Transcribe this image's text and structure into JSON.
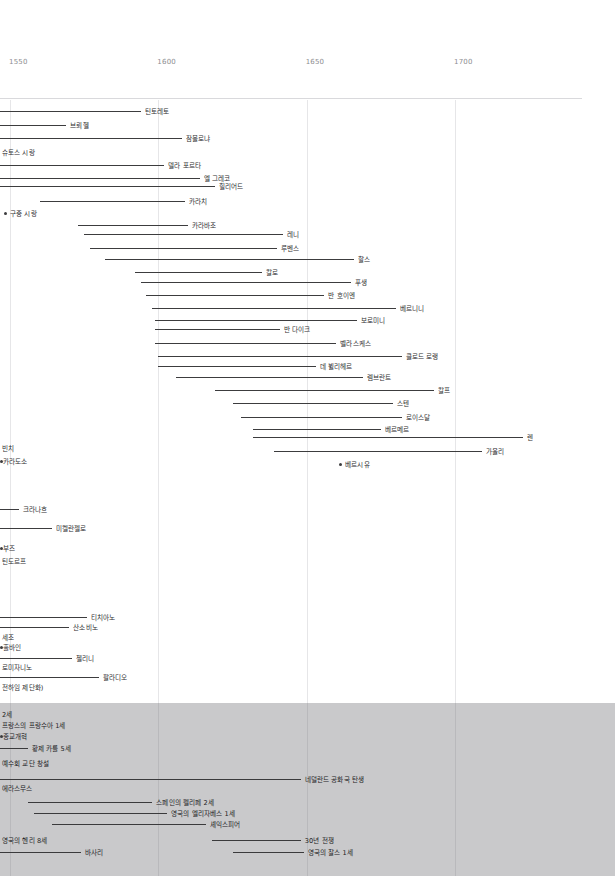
{
  "chart_data": {
    "type": "table",
    "title": "",
    "subtitle": "",
    "xlabel": "",
    "ylabel": "",
    "xlim": [
      1530,
      1720
    ],
    "grid": true,
    "legend": "none",
    "axis": {
      "ticks": [
        {
          "label": "1550",
          "value": 1550
        },
        {
          "label": "1600",
          "value": 1600
        },
        {
          "label": "1650",
          "value": 1650
        },
        {
          "label": "1700",
          "value": 1700
        }
      ]
    },
    "artists": [
      {
        "label": "틴토레토",
        "start": 1530,
        "end": 1594,
        "marker": "bar"
      },
      {
        "label": "브뢰헬",
        "start": 1530,
        "end": 1569,
        "marker": "bar"
      },
      {
        "label": "잠볼로냐",
        "start": 1530,
        "end": 1608,
        "marker": "bar"
      },
      {
        "label": "슈토스 시랑",
        "start": 1530,
        "end": 1530,
        "marker": "none"
      },
      {
        "label": "델라 포르타",
        "start": 1530,
        "end": 1602,
        "marker": "bar"
      },
      {
        "label": "엘 그레코",
        "start": 1530,
        "end": 1614,
        "marker": "bar"
      },
      {
        "label": "힐리어드",
        "start": 1530,
        "end": 1619,
        "marker": "bar"
      },
      {
        "label": "카라치",
        "start": 1560,
        "end": 1609,
        "marker": "bar"
      },
      {
        "label": "구중 시랑",
        "start": 1548,
        "end": 1548,
        "marker": "dot"
      },
      {
        "label": "카라바조",
        "start": 1573,
        "end": 1610,
        "marker": "bar"
      },
      {
        "label": "레니",
        "start": 1575,
        "end": 1642,
        "marker": "bar"
      },
      {
        "label": "루벤스",
        "start": 1577,
        "end": 1640,
        "marker": "bar"
      },
      {
        "label": "할스",
        "start": 1582,
        "end": 1666,
        "marker": "bar"
      },
      {
        "label": "칼로",
        "start": 1592,
        "end": 1635,
        "marker": "bar"
      },
      {
        "label": "푸생",
        "start": 1594,
        "end": 1665,
        "marker": "bar"
      },
      {
        "label": "반 호이엔",
        "start": 1596,
        "end": 1656,
        "marker": "bar"
      },
      {
        "label": "베르니니",
        "start": 1598,
        "end": 1680,
        "marker": "bar"
      },
      {
        "label": "보로미니",
        "start": 1599,
        "end": 1667,
        "marker": "bar"
      },
      {
        "label": "반 다이크",
        "start": 1599,
        "end": 1641,
        "marker": "bar"
      },
      {
        "label": "벨라스케스",
        "start": 1599,
        "end": 1660,
        "marker": "bar"
      },
      {
        "label": "클로드 로랭",
        "start": 1600,
        "end": 1682,
        "marker": "bar"
      },
      {
        "label": "데 뷜리헤르",
        "start": 1600,
        "end": 1653,
        "marker": "bar"
      },
      {
        "label": "렘브란트",
        "start": 1606,
        "end": 1669,
        "marker": "bar"
      },
      {
        "label": "칼프",
        "start": 1619,
        "end": 1693,
        "marker": "bar"
      },
      {
        "label": "스텐",
        "start": 1625,
        "end": 1679,
        "marker": "bar"
      },
      {
        "label": "로이스달",
        "start": 1628,
        "end": 1682,
        "marker": "bar"
      },
      {
        "label": "베르메르",
        "start": 1632,
        "end": 1675,
        "marker": "bar"
      },
      {
        "label": "렌",
        "start": 1632,
        "end": 1723,
        "marker": "bar"
      },
      {
        "label": "가울리",
        "start": 1639,
        "end": 1709,
        "marker": "bar"
      },
      {
        "label": "베르시유",
        "start": 1661,
        "end": 1661,
        "marker": "dot"
      },
      {
        "label": "빈치",
        "start": 1530,
        "end": 1530,
        "marker": "none"
      },
      {
        "label": "카라도소",
        "start": 1530,
        "end": 1530,
        "marker": "dot-left"
      },
      {
        "label": "크라나흐",
        "start": 1530,
        "end": 1553,
        "marker": "bar"
      },
      {
        "label": "미켈란젤로",
        "start": 1530,
        "end": 1564,
        "marker": "bar"
      },
      {
        "label": "부즈",
        "start": 1530,
        "end": 1530,
        "marker": "dot-left"
      },
      {
        "label": "틴도르프",
        "start": 1530,
        "end": 1530,
        "marker": "none"
      },
      {
        "label": "티치아노",
        "start": 1530,
        "end": 1576,
        "marker": "bar"
      },
      {
        "label": "산소비노",
        "start": 1530,
        "end": 1570,
        "marker": "bar"
      },
      {
        "label": "세조",
        "start": 1530,
        "end": 1530,
        "marker": "none"
      },
      {
        "label": "홀바인",
        "start": 1530,
        "end": 1530,
        "marker": "dot-left"
      },
      {
        "label": "첼리니",
        "start": 1530,
        "end": 1571,
        "marker": "bar"
      },
      {
        "label": "로미자니노",
        "start": 1530,
        "end": 1530,
        "marker": "none"
      },
      {
        "label": "팔라디오",
        "start": 1530,
        "end": 1580,
        "marker": "bar"
      },
      {
        "label": "전하임 제단화)",
        "start": 1530,
        "end": 1530,
        "marker": "none"
      }
    ],
    "events": [
      {
        "label": "2세",
        "start": 1530,
        "end": 1530,
        "marker": "none"
      },
      {
        "label": "프랑스의 프랑수아 1세",
        "start": 1530,
        "end": 1530,
        "marker": "none"
      },
      {
        "label": "종교개혁",
        "start": 1530,
        "end": 1530,
        "marker": "dot-left"
      },
      {
        "label": "황제 카를 5세",
        "start": 1530,
        "end": 1556,
        "marker": "bar"
      },
      {
        "label": "예수회 교단 창설",
        "start": 1530,
        "end": 1530,
        "marker": "none"
      },
      {
        "label": "네덜란드 공화국 탄생",
        "start": 1530,
        "end": 1648,
        "marker": "bar"
      },
      {
        "label": "에라스무스",
        "start": 1530,
        "end": 1530,
        "marker": "none"
      },
      {
        "label": "스페인의 펠리페 2세",
        "start": 1556,
        "end": 1598,
        "marker": "bar"
      },
      {
        "label": "영국의 엘리자베스 1세",
        "start": 1558,
        "end": 1603,
        "marker": "bar"
      },
      {
        "label": "셰익스피어",
        "start": 1564,
        "end": 1616,
        "marker": "bar"
      },
      {
        "label": "영국의 헨리 8세",
        "start": 1530,
        "end": 1530,
        "marker": "none"
      },
      {
        "label": "30년 전쟁",
        "start": 1618,
        "end": 1648,
        "marker": "bar"
      },
      {
        "label": "바사리",
        "start": 1530,
        "end": 1574,
        "marker": "bar"
      },
      {
        "label": "영국의 찰스 1세",
        "start": 1625,
        "end": 1649,
        "marker": "bar"
      }
    ],
    "colors": {
      "bar": "#3c3c3e",
      "gridline": "#e6e6e8",
      "axis_text": "#8d8d90",
      "label_text": "#2e2e30",
      "band_background": "#c9c9cb",
      "page_background": "#ffffff"
    }
  }
}
